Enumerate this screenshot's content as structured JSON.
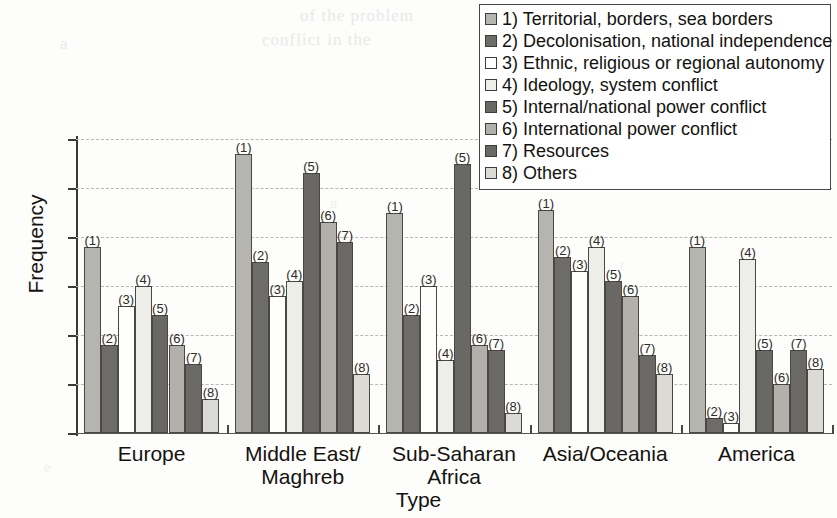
{
  "chart_data": {
    "type": "bar",
    "title": "",
    "xlabel": "Type",
    "ylabel": "Frequency",
    "ylim": [
      0,
      60
    ],
    "yticks": [
      0,
      10,
      20,
      30,
      40,
      50,
      60
    ],
    "grid": true,
    "legend_position": "top-right",
    "categories": [
      "Europe",
      "Middle East/\nMaghreb",
      "Sub-Saharan\nAfrica",
      "Asia/Oceania",
      "America"
    ],
    "category_lines": [
      [
        "Europe"
      ],
      [
        "Middle East/",
        "Maghreb"
      ],
      [
        "Sub-Saharan",
        "Africa"
      ],
      [
        "Asia/Oceania"
      ],
      [
        "America"
      ]
    ],
    "series": [
      {
        "key": "1",
        "name": "1) Territorial, borders, sea borders",
        "label": "(1)",
        "color": "#b6b4ae",
        "values": [
          38,
          57,
          45,
          45.5,
          38
        ]
      },
      {
        "key": "2",
        "name": "2) Decolonisation, national independence",
        "label": "(2)",
        "color": "#6e6c68",
        "values": [
          18,
          35,
          24,
          36,
          3
        ]
      },
      {
        "key": "3",
        "name": "3) Ethnic, religious or regional autonomy",
        "label": "(3)",
        "color": "#fefefd",
        "values": [
          26,
          28,
          30,
          33,
          2
        ]
      },
      {
        "key": "4",
        "name": "4) Ideology, system conflict",
        "label": "(4)",
        "color": "#eeeee9",
        "values": [
          30,
          31,
          15,
          38,
          35.5
        ]
      },
      {
        "key": "5",
        "name": "5) Internal/national power conflict",
        "label": "(5)",
        "color": "#6a6864",
        "values": [
          24,
          53,
          55,
          31,
          17
        ]
      },
      {
        "key": "6",
        "name": "6) International power conflict",
        "label": "(6)",
        "color": "#b2b0aa",
        "values": [
          18,
          43,
          18,
          28,
          10
        ]
      },
      {
        "key": "7",
        "name": "7) Resources",
        "label": "(7)",
        "color": "#6b6965",
        "values": [
          14,
          39,
          17,
          16,
          17
        ]
      },
      {
        "key": "8",
        "name": "8) Others",
        "label": "(8)",
        "color": "#dcdad4",
        "values": [
          7,
          12,
          4,
          12,
          13
        ]
      }
    ]
  },
  "legend": {
    "items": [
      {
        "swatch": "#b6b4ae",
        "label": "1) Territorial, borders, sea borders"
      },
      {
        "swatch": "#6e6c68",
        "label": "2) Decolonisation, national independence"
      },
      {
        "swatch": "#fefefd",
        "label": "3) Ethnic, religious or regional autonomy"
      },
      {
        "swatch": "#eeeee9",
        "label": "4) Ideology, system conflict"
      },
      {
        "swatch": "#6a6864",
        "label": "5) Internal/national power conflict"
      },
      {
        "swatch": "#b2b0aa",
        "label": "6) International power conflict"
      },
      {
        "swatch": "#6b6965",
        "label": "7) Resources"
      },
      {
        "swatch": "#dcdad4",
        "label": "8) Others"
      }
    ]
  },
  "artifacts": {
    "bleed_1": "of the problem",
    "bleed_2": "conflict  in  the",
    "bleed_3": "a",
    "bleed_4": "n",
    "bleed_5": "t",
    "bleed_6": "e"
  }
}
